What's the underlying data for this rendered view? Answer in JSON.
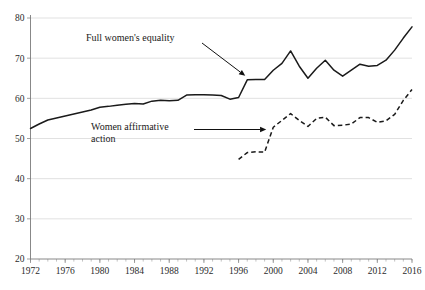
{
  "chart_data": {
    "type": "line",
    "title": "",
    "subtitle": "",
    "xlabel": "",
    "ylabel": "",
    "xlim": [
      1972,
      2016
    ],
    "ylim": [
      20,
      80
    ],
    "yticks": [
      20,
      30,
      40,
      50,
      60,
      70,
      80
    ],
    "xticks": [
      1972,
      1976,
      1980,
      1984,
      1988,
      1992,
      1996,
      2000,
      2004,
      2008,
      2012,
      2016
    ],
    "xtick_labels": [
      "1972",
      "1976",
      "1980",
      "1984",
      "1988",
      "1992",
      "1996",
      "2000",
      "2004",
      "2008",
      "2012",
      "2016"
    ],
    "ytick_labels": [
      "20",
      "30",
      "40",
      "50",
      "60",
      "70",
      "80"
    ],
    "x_minor_tick_step": 1,
    "grid": "horizontal",
    "legend": "none",
    "series": [
      {
        "name": "Full women's equality",
        "style": "solid",
        "color": "#1a1a1a",
        "x": [
          1972,
          1973,
          1974,
          1975,
          1976,
          1977,
          1978,
          1979,
          1980,
          1981,
          1982,
          1983,
          1984,
          1985,
          1986,
          1987,
          1988,
          1989,
          1990,
          1991,
          1992,
          1993,
          1994,
          1995,
          1996,
          1997,
          1998,
          1999,
          2000,
          2001,
          2002,
          2003,
          2004,
          2005,
          2006,
          2007,
          2008,
          2009,
          2010,
          2011,
          2012,
          2013,
          2014,
          2015,
          2016
        ],
        "values": [
          52.5,
          53.6,
          54.6,
          55.1,
          55.6,
          56.1,
          56.6,
          57.1,
          57.8,
          58.0,
          58.3,
          58.5,
          58.7,
          58.6,
          59.3,
          59.5,
          59.4,
          59.5,
          60.8,
          60.9,
          60.9,
          60.8,
          60.7,
          59.8,
          60.2,
          64.6,
          64.7,
          64.7,
          67.0,
          68.7,
          71.8,
          68.0,
          65.0,
          67.5,
          69.5,
          67.0,
          65.5,
          67.0,
          68.5,
          68.0,
          68.2,
          69.5,
          72.0,
          75.0,
          77.8
        ]
      },
      {
        "name": "Women affirmative action",
        "style": "dashed",
        "color": "#1a1a1a",
        "x": [
          1996,
          1997,
          1998,
          1999,
          2000,
          2001,
          2002,
          2003,
          2004,
          2005,
          2006,
          2007,
          2008,
          2009,
          2010,
          2011,
          2012,
          2013,
          2014,
          2015,
          2016
        ],
        "values": [
          44.8,
          46.5,
          46.7,
          46.6,
          52.8,
          54.5,
          56.2,
          54.5,
          53.0,
          55.0,
          55.3,
          53.2,
          53.3,
          53.6,
          55.2,
          55.2,
          54.0,
          54.4,
          56.0,
          59.5,
          62.2
        ]
      }
    ],
    "annotations": [
      {
        "id": "annot-full-equality",
        "text": "Full women's equality",
        "text_lines": [
          "Full women's equality"
        ],
        "target_x": 1997,
        "target_y": 64.6
      },
      {
        "id": "annot-affirmative-action",
        "text": "Women affirmative action",
        "text_lines": [
          "Women affirmative",
          "action"
        ],
        "target_x": 2000,
        "target_y": 52.8
      }
    ]
  }
}
